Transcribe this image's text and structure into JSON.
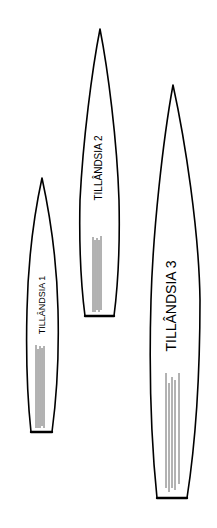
{
  "diagram": {
    "background": "#ffffff",
    "stroke_color": "#000000",
    "vein_color": "#555555",
    "leaves": [
      {
        "id": "leaf-1",
        "label": "TILLÂNDSIA 1",
        "tip": [
          42,
          178
        ],
        "base_y": 434,
        "font_size": 9
      },
      {
        "id": "leaf-2",
        "label": "TILLÂNDSIA 2",
        "tip": [
          100,
          29
        ],
        "base_y": 317,
        "font_size": 10
      },
      {
        "id": "leaf-3",
        "label": "TILLÂNDSIA 3",
        "tip": [
          173,
          85
        ],
        "base_y": 499,
        "font_size": 14
      }
    ]
  }
}
